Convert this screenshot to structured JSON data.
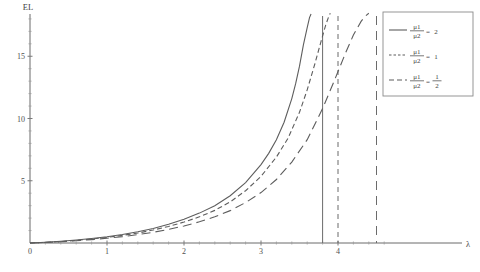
{
  "chart_data": {
    "type": "line",
    "title": "",
    "subtitle": "",
    "xlabel": "λ",
    "ylabel": "EL",
    "xlim": [
      0,
      4.8
    ],
    "ylim": [
      0,
      18.5
    ],
    "grid": false,
    "legend_position": "top-right",
    "x_ticks": [
      "0",
      "1",
      "2",
      "3",
      "4"
    ],
    "x_tick_values": [
      0,
      1,
      2,
      3,
      4
    ],
    "y_ticks": [
      "5",
      "10",
      "15"
    ],
    "y_tick_values": [
      5,
      10,
      15
    ],
    "x_minor_step": 0.2,
    "y_minor_step": 1,
    "series": [
      {
        "name": "mu1_over_mu2_eq_2",
        "legend_numerator": "μ1",
        "legend_denominator": "μ2",
        "legend_equals": "=",
        "legend_value": "2",
        "style": "solid",
        "asymptote": 3.8,
        "x": [
          0.0,
          0.2,
          0.4,
          0.6,
          0.8,
          1.0,
          1.2,
          1.4,
          1.6,
          1.8,
          2.0,
          2.2,
          2.4,
          2.6,
          2.8,
          3.0,
          3.1,
          3.2,
          3.3,
          3.4,
          3.45,
          3.5,
          3.55,
          3.6,
          3.63,
          3.65
        ],
        "y": [
          0.0,
          0.06,
          0.14,
          0.24,
          0.36,
          0.5,
          0.68,
          0.9,
          1.16,
          1.5,
          1.9,
          2.4,
          3.0,
          3.8,
          4.85,
          6.3,
          7.2,
          8.3,
          9.7,
          11.6,
          12.8,
          14.2,
          15.9,
          17.3,
          18.1,
          18.4
        ]
      },
      {
        "name": "mu1_over_mu2_eq_1",
        "legend_numerator": "μ1",
        "legend_denominator": "μ2",
        "legend_equals": "=",
        "legend_value": "1",
        "style": "dashed",
        "asymptote": 4.0,
        "x": [
          0.0,
          0.2,
          0.4,
          0.6,
          0.8,
          1.0,
          1.2,
          1.4,
          1.6,
          1.8,
          2.0,
          2.2,
          2.4,
          2.6,
          2.8,
          3.0,
          3.2,
          3.35,
          3.5,
          3.6,
          3.7,
          3.78,
          3.84,
          3.88,
          3.9
        ],
        "y": [
          0.0,
          0.05,
          0.12,
          0.21,
          0.32,
          0.45,
          0.61,
          0.8,
          1.04,
          1.33,
          1.68,
          2.1,
          2.62,
          3.3,
          4.2,
          5.35,
          6.9,
          8.4,
          10.5,
          12.3,
          14.4,
          16.2,
          17.5,
          18.2,
          18.45
        ]
      },
      {
        "name": "mu1_over_mu2_eq_one_half",
        "legend_numerator": "μ1",
        "legend_denominator": "μ2",
        "legend_equals": "=",
        "legend_value_num": "1",
        "legend_value_den": "2",
        "style": "longdash",
        "asymptote": 4.5,
        "x": [
          0.0,
          0.2,
          0.4,
          0.6,
          0.8,
          1.0,
          1.2,
          1.4,
          1.6,
          1.8,
          2.0,
          2.2,
          2.4,
          2.6,
          2.8,
          3.0,
          3.2,
          3.4,
          3.6,
          3.8,
          3.95,
          4.1,
          4.2,
          4.3,
          4.35,
          4.4
        ],
        "y": [
          0.0,
          0.04,
          0.1,
          0.18,
          0.27,
          0.38,
          0.51,
          0.67,
          0.86,
          1.09,
          1.37,
          1.7,
          2.1,
          2.6,
          3.25,
          4.05,
          5.1,
          6.5,
          8.3,
          10.8,
          13.0,
          15.3,
          16.7,
          17.8,
          18.2,
          18.45
        ]
      }
    ],
    "asymptote_lines": [
      {
        "name": "asymptote-solid",
        "x": 3.8,
        "style": "solid"
      },
      {
        "name": "asymptote-dashed",
        "x": 4.0,
        "style": "dashed"
      },
      {
        "name": "asymptote-longdash",
        "x": 4.5,
        "style": "longdash"
      }
    ]
  }
}
